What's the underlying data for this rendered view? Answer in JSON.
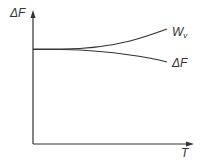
{
  "diagram": {
    "y_axis_label": "ΔF",
    "x_axis_label": "T",
    "curves": [
      {
        "name": "W_v",
        "label_main": "W",
        "label_sub": "v",
        "direction": "increasing"
      },
      {
        "name": "ΔF",
        "label_main": "ΔF",
        "direction": "decreasing"
      }
    ],
    "colors": {
      "line": "#333333",
      "background": "#ffffff"
    }
  }
}
